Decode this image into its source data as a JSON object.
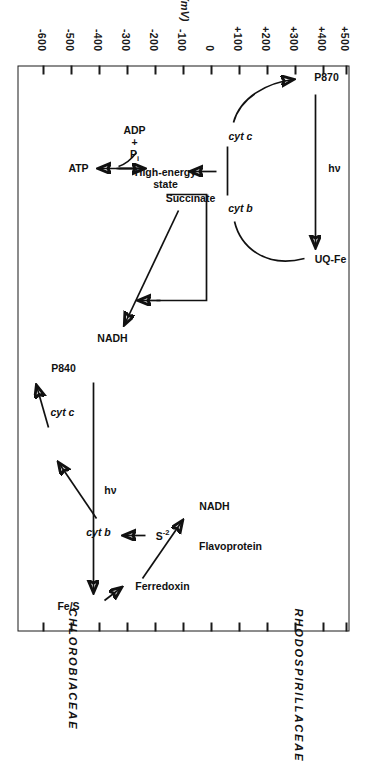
{
  "figure": {
    "orientation": "rotated-90-ccw",
    "axis": {
      "title_symbol": "E",
      "title_sub": "m",
      "title_units": "(mV)",
      "ticks": [
        "-600",
        "-500",
        "-400",
        "-300",
        "-200",
        "-100",
        "0",
        "+100",
        "+200",
        "+300",
        "+400",
        "+500"
      ],
      "min": -600,
      "max": 500
    },
    "panels": [
      {
        "name": "CHLOROBIACEAE",
        "nodes": [
          {
            "id": "sulfide",
            "label": "S",
            "sup": "-2",
            "em": -240
          },
          {
            "id": "cyt-b",
            "label": "cyt b",
            "italic": true,
            "em": -110
          },
          {
            "id": "cyt-c",
            "label": "cyt c",
            "italic": true,
            "em": 155
          },
          {
            "id": "p840",
            "label": "P840",
            "em": 310
          },
          {
            "id": "fe-s",
            "label": "Fe/S",
            "em": -545
          },
          {
            "id": "ferredoxin",
            "label": "Ferredoxin",
            "em": -500
          },
          {
            "id": "flavoprotein",
            "label": "Flavoprotein",
            "em": -400
          },
          {
            "id": "nadh",
            "label": "NADH",
            "em": -320
          }
        ],
        "edge_labels": [
          {
            "id": "photon",
            "label": "hν"
          }
        ]
      },
      {
        "name": "RHODOSPIRILLACEAE",
        "nodes": [
          {
            "id": "uq-fe",
            "label": "UQ-Fe",
            "em": -170
          },
          {
            "id": "cyt-b2",
            "label": "cyt b",
            "italic": true,
            "em": 55
          },
          {
            "id": "cyt-c2",
            "label": "cyt c",
            "italic": true,
            "em": 250
          },
          {
            "id": "p870",
            "label": "P870",
            "em": 450
          },
          {
            "id": "high-energy",
            "label": "High-energy\nstate",
            "em": 95
          },
          {
            "id": "atp",
            "label": "ATP",
            "em": 95
          },
          {
            "id": "adp-pi",
            "label": "ADP\n+\nP",
            "sub": "i",
            "em": 95
          },
          {
            "id": "succinate",
            "label": "Succinate",
            "em": -30
          },
          {
            "id": "nadh2",
            "label": "NADH",
            "em": -320
          }
        ],
        "edge_labels": [
          {
            "id": "photon2",
            "label": "hν"
          }
        ]
      }
    ],
    "colors": {
      "ink": "#111111",
      "background": "#ffffff",
      "frame": "#1a1a1a"
    }
  }
}
